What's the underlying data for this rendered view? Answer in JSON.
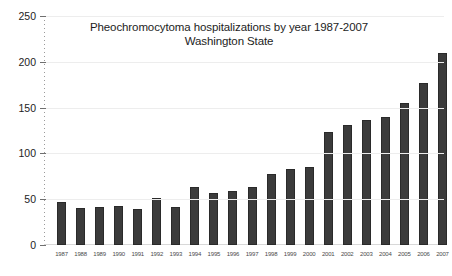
{
  "chart_data": {
    "type": "bar",
    "title": "Pheochromocytoma hospitalizations by year 1987-2007",
    "subtitle": "Washington State",
    "title_lines": [
      "Pheochromocytoma hospitalizations by year 1987-2007",
      "Washington State"
    ],
    "xlabel": "",
    "ylabel": "",
    "ylim": [
      0,
      250
    ],
    "ytick_labels": [
      "0",
      "50",
      "100",
      "150",
      "200",
      "250"
    ],
    "ytick_values": [
      0,
      50,
      100,
      150,
      200,
      250
    ],
    "grid": true,
    "legend": null,
    "bar_color": "#3b3b3b",
    "background_color": "#ffffff",
    "categories": [
      "1987",
      "1988",
      "1989",
      "1990",
      "1991",
      "1992",
      "1993",
      "1994",
      "1995",
      "1996",
      "1997",
      "1998",
      "1999",
      "2000",
      "2001",
      "2002",
      "2003",
      "2004",
      "2005",
      "2006",
      "2007"
    ],
    "values": [
      47,
      40,
      42,
      43,
      39,
      51,
      41,
      63,
      57,
      59,
      63,
      78,
      83,
      85,
      123,
      131,
      136,
      140,
      155,
      177,
      210
    ]
  }
}
